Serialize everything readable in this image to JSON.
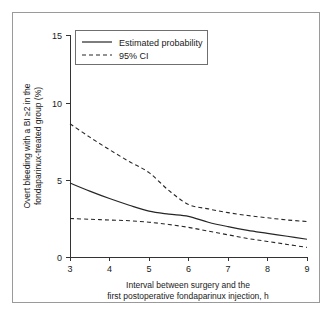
{
  "chart_data": {
    "type": "line",
    "title": "",
    "xlabel": "Interval between surgery and the first postoperative fondaparinux injection, h",
    "xlabel_line1": "Interval between surgery and the",
    "xlabel_line2": "first postoperative fondaparinux injection, h",
    "ylabel": "Overt bleeding with a BI ≥2 in the fondaparinux-treated group (%)",
    "ylabel_line1": "Overt bleeding with a BI ≥2 in the",
    "ylabel_line2": "fondaparinux-treated group (%)",
    "xlim": [
      3,
      9
    ],
    "ylim": [
      0,
      15
    ],
    "xticks": [
      3,
      4,
      5,
      6,
      7,
      8,
      9
    ],
    "xtick_labels": [
      "3",
      "4",
      "5",
      "6",
      "7",
      "8",
      "9"
    ],
    "yticks": [
      0,
      5,
      10,
      15
    ],
    "ytick_labels": [
      "0",
      "5",
      "10",
      "15"
    ],
    "grid": false,
    "legend_position": "top-left",
    "x": [
      3,
      3.5,
      4,
      4.5,
      5,
      5.5,
      6,
      6.5,
      7,
      7.5,
      8,
      8.5,
      9
    ],
    "series": [
      {
        "name": "Estimated probability",
        "style": "solid",
        "values": [
          5.0,
          4.45,
          3.95,
          3.5,
          3.1,
          2.9,
          2.75,
          2.35,
          2.05,
          1.8,
          1.6,
          1.4,
          1.2
        ]
      },
      {
        "name": "95% CI upper",
        "style": "dashed",
        "values": [
          9.0,
          8.1,
          7.25,
          6.45,
          5.7,
          4.5,
          3.55,
          3.25,
          3.0,
          2.8,
          2.65,
          2.5,
          2.4
        ]
      },
      {
        "name": "95% CI lower",
        "style": "dashed",
        "values": [
          2.6,
          2.55,
          2.5,
          2.45,
          2.35,
          2.2,
          2.0,
          1.75,
          1.5,
          1.25,
          1.05,
          0.85,
          0.65
        ]
      }
    ],
    "legend": [
      {
        "label": "Estimated probability",
        "style": "solid"
      },
      {
        "label": "95% CI",
        "style": "dashed"
      }
    ],
    "colors": {
      "line": "#262626",
      "axis": "#333333",
      "frame": "#9a9a9a",
      "background": "#ffffff"
    }
  }
}
